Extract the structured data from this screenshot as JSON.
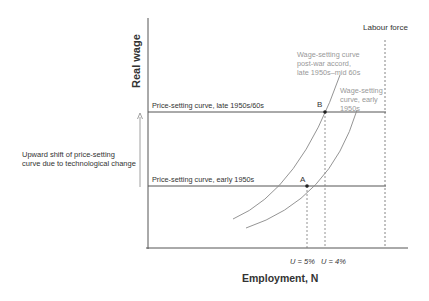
{
  "diagram": {
    "y_axis_label": "Real wage",
    "x_axis_label": "Employment, N",
    "labour_force_label": "Labour force",
    "price_setting_upper": "Price-setting curve, late 1950s/60s",
    "price_setting_lower": "Price-setting curve, early 1950s",
    "wage_setting_postwar": [
      "Wage-setting curve",
      "post-war accord,",
      "late 1950s–mid 60s"
    ],
    "wage_setting_early": [
      "Wage-setting",
      "curve, early",
      "1950s"
    ],
    "point_a": "A",
    "point_b": "B",
    "u5_label": "U = 5%",
    "u4_label": "U = 4%",
    "shift_annotation": [
      "Upward shift of price-setting",
      "curve due to technological change"
    ]
  },
  "colors": {
    "axis": "#555555",
    "curve": "#888888",
    "price_line": "#555555",
    "annotation_text": "#999999",
    "text": "#333333"
  }
}
